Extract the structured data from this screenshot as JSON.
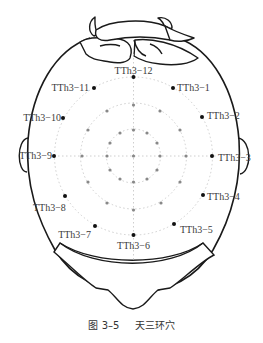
{
  "figure": {
    "title": "天三环穴",
    "number": "图 3-5",
    "center": [
      133.5,
      156
    ],
    "ring_radii": [
      27,
      53,
      79
    ],
    "colors": {
      "outline": "#1a1a1a",
      "acupoint": "#111111",
      "grid_dot": "#888888",
      "guide": "#c8c8c8",
      "label": "#3a3a3a"
    }
  },
  "acupoints": [
    {
      "id": "TTh3-12",
      "label": "TTh3−12",
      "clock": 12
    },
    {
      "id": "TTh3-1",
      "label": "TTh3−1",
      "clock": 1
    },
    {
      "id": "TTh3-2",
      "label": "TTh3−2",
      "clock": 2
    },
    {
      "id": "TTh3-3",
      "label": "TTh3−3",
      "clock": 3
    },
    {
      "id": "TTh3-4",
      "label": "TTh3−4",
      "clock": 4
    },
    {
      "id": "TTh3-5",
      "label": "TTh3−5",
      "clock": 5
    },
    {
      "id": "TTh3-6",
      "label": "TTh3−6",
      "clock": 6
    },
    {
      "id": "TTh3-7",
      "label": "TTh3−7",
      "clock": 7
    },
    {
      "id": "TTh3-8",
      "label": "TTh3−8",
      "clock": 8
    },
    {
      "id": "TTh3-9",
      "label": "TTh3−9",
      "clock": 9
    },
    {
      "id": "TTh3-10",
      "label": "TTh3−10",
      "clock": 10
    },
    {
      "id": "TTh3-11",
      "label": "TTh3−11",
      "clock": 11
    }
  ],
  "labels": {
    "p12": "TTh3−12",
    "p1": "TTh3−1",
    "p2": "TTh3−2",
    "p3": "TTh3−3",
    "p4": "TTh3−4",
    "p5": "TTh3−5",
    "p6": "TTh3−6",
    "p7": "TTh3−7",
    "p8": "TTh3−8",
    "p9": "TTh3−9",
    "p10": "TTh3−10",
    "p11": "TTh3−11"
  },
  "caption": {
    "number": "图 3–5",
    "title": "天三环穴"
  }
}
